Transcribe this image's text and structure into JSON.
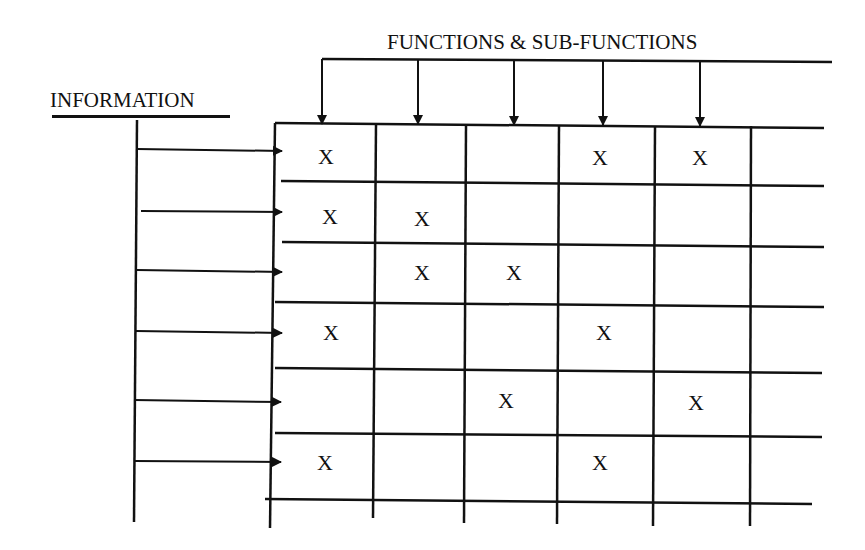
{
  "diagram": {
    "title_top": "FUNCTIONS & SUB-FUNCTIONS",
    "title_left": "INFORMATION",
    "mark_symbol": "X",
    "line_color": "#111111",
    "background_color": "#ffffff",
    "rows": 6,
    "columns": 6,
    "function_arrows": 5,
    "information_arrows": 6,
    "matrix": [
      [
        "X",
        "",
        "",
        "X",
        "X",
        ""
      ],
      [
        "X",
        "X",
        "",
        "",
        "",
        ""
      ],
      [
        "",
        "X",
        "X",
        "",
        "",
        ""
      ],
      [
        "X",
        "",
        "",
        "X",
        "",
        ""
      ],
      [
        "",
        "",
        "X",
        "",
        "X",
        ""
      ],
      [
        "X",
        "",
        "",
        "X",
        "",
        ""
      ]
    ],
    "marks": {
      "r0c0": "X",
      "r0c3": "X",
      "r0c4": "X",
      "r1c0": "X",
      "r1c1": "X",
      "r2c1": "X",
      "r2c2": "X",
      "r3c0": "X",
      "r3c3": "X",
      "r4c2": "X",
      "r4c4": "X",
      "r5c0": "X",
      "r5c3": "X"
    }
  }
}
